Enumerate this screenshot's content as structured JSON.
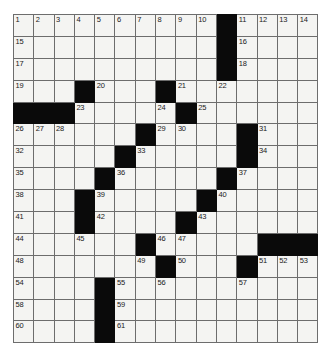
{
  "puzzle": {
    "type": "crossword-grid",
    "rows": 15,
    "columns": 15,
    "cell_fill_color": "#f4f4f2",
    "block_color": "#0a0a0a",
    "grid_line_color": "#6d6d6d",
    "number_color": "#1a1a1a",
    "background_color": "#ffffff",
    "highest_clue_number": 61,
    "block_count": 51,
    "grid": [
      [
        {
          "block": false,
          "num": "1"
        },
        {
          "block": false,
          "num": "2"
        },
        {
          "block": false,
          "num": "3"
        },
        {
          "block": false,
          "num": "4"
        },
        {
          "block": false,
          "num": "5"
        },
        {
          "block": false,
          "num": "6"
        },
        {
          "block": false,
          "num": "7"
        },
        {
          "block": false,
          "num": "8"
        },
        {
          "block": false,
          "num": "9"
        },
        {
          "block": false,
          "num": "10"
        },
        {
          "block": true,
          "num": ""
        },
        {
          "block": false,
          "num": "11"
        },
        {
          "block": false,
          "num": "12"
        },
        {
          "block": false,
          "num": "13"
        },
        {
          "block": false,
          "num": "14"
        }
      ],
      [
        {
          "block": false,
          "num": "15"
        },
        {
          "block": false,
          "num": ""
        },
        {
          "block": false,
          "num": ""
        },
        {
          "block": false,
          "num": ""
        },
        {
          "block": false,
          "num": ""
        },
        {
          "block": false,
          "num": ""
        },
        {
          "block": false,
          "num": ""
        },
        {
          "block": false,
          "num": ""
        },
        {
          "block": false,
          "num": ""
        },
        {
          "block": false,
          "num": ""
        },
        {
          "block": true,
          "num": ""
        },
        {
          "block": false,
          "num": "16"
        },
        {
          "block": false,
          "num": ""
        },
        {
          "block": false,
          "num": ""
        },
        {
          "block": false,
          "num": ""
        }
      ],
      [
        {
          "block": false,
          "num": "17"
        },
        {
          "block": false,
          "num": ""
        },
        {
          "block": false,
          "num": ""
        },
        {
          "block": false,
          "num": ""
        },
        {
          "block": false,
          "num": ""
        },
        {
          "block": false,
          "num": ""
        },
        {
          "block": false,
          "num": ""
        },
        {
          "block": false,
          "num": ""
        },
        {
          "block": false,
          "num": ""
        },
        {
          "block": false,
          "num": ""
        },
        {
          "block": true,
          "num": ""
        },
        {
          "block": false,
          "num": "18"
        },
        {
          "block": false,
          "num": ""
        },
        {
          "block": false,
          "num": ""
        },
        {
          "block": false,
          "num": ""
        }
      ],
      [
        {
          "block": false,
          "num": "19"
        },
        {
          "block": false,
          "num": ""
        },
        {
          "block": false,
          "num": ""
        },
        {
          "block": true,
          "num": ""
        },
        {
          "block": false,
          "num": "20"
        },
        {
          "block": false,
          "num": ""
        },
        {
          "block": false,
          "num": ""
        },
        {
          "block": true,
          "num": ""
        },
        {
          "block": false,
          "num": "21"
        },
        {
          "block": false,
          "num": ""
        },
        {
          "block": false,
          "num": "22"
        },
        {
          "block": false,
          "num": ""
        },
        {
          "block": false,
          "num": ""
        },
        {
          "block": false,
          "num": ""
        },
        {
          "block": false,
          "num": ""
        }
      ],
      [
        {
          "block": true,
          "num": ""
        },
        {
          "block": true,
          "num": ""
        },
        {
          "block": true,
          "num": ""
        },
        {
          "block": false,
          "num": "23"
        },
        {
          "block": false,
          "num": ""
        },
        {
          "block": false,
          "num": ""
        },
        {
          "block": false,
          "num": ""
        },
        {
          "block": false,
          "num": "24"
        },
        {
          "block": true,
          "num": ""
        },
        {
          "block": false,
          "num": "25"
        },
        {
          "block": false,
          "num": ""
        },
        {
          "block": false,
          "num": ""
        },
        {
          "block": false,
          "num": ""
        },
        {
          "block": false,
          "num": ""
        },
        {
          "block": false,
          "num": ""
        }
      ],
      [
        {
          "block": false,
          "num": "26"
        },
        {
          "block": false,
          "num": "27"
        },
        {
          "block": false,
          "num": "28"
        },
        {
          "block": false,
          "num": ""
        },
        {
          "block": false,
          "num": ""
        },
        {
          "block": false,
          "num": ""
        },
        {
          "block": true,
          "num": ""
        },
        {
          "block": false,
          "num": "29"
        },
        {
          "block": false,
          "num": "30"
        },
        {
          "block": false,
          "num": ""
        },
        {
          "block": false,
          "num": ""
        },
        {
          "block": true,
          "num": ""
        },
        {
          "block": false,
          "num": "31"
        },
        {
          "block": false,
          "num": ""
        },
        {
          "block": false,
          "num": ""
        }
      ],
      [
        {
          "block": false,
          "num": "32"
        },
        {
          "block": false,
          "num": ""
        },
        {
          "block": false,
          "num": ""
        },
        {
          "block": false,
          "num": ""
        },
        {
          "block": false,
          "num": ""
        },
        {
          "block": true,
          "num": ""
        },
        {
          "block": false,
          "num": "33"
        },
        {
          "block": false,
          "num": ""
        },
        {
          "block": false,
          "num": ""
        },
        {
          "block": false,
          "num": ""
        },
        {
          "block": false,
          "num": ""
        },
        {
          "block": true,
          "num": ""
        },
        {
          "block": false,
          "num": "34"
        },
        {
          "block": false,
          "num": ""
        },
        {
          "block": false,
          "num": ""
        }
      ],
      [
        {
          "block": false,
          "num": "35"
        },
        {
          "block": false,
          "num": ""
        },
        {
          "block": false,
          "num": ""
        },
        {
          "block": false,
          "num": ""
        },
        {
          "block": true,
          "num": ""
        },
        {
          "block": false,
          "num": "36"
        },
        {
          "block": false,
          "num": ""
        },
        {
          "block": false,
          "num": ""
        },
        {
          "block": false,
          "num": ""
        },
        {
          "block": false,
          "num": ""
        },
        {
          "block": true,
          "num": ""
        },
        {
          "block": false,
          "num": "37"
        },
        {
          "block": false,
          "num": ""
        },
        {
          "block": false,
          "num": ""
        },
        {
          "block": false,
          "num": ""
        }
      ],
      [
        {
          "block": false,
          "num": "38"
        },
        {
          "block": false,
          "num": ""
        },
        {
          "block": false,
          "num": ""
        },
        {
          "block": true,
          "num": ""
        },
        {
          "block": false,
          "num": "39"
        },
        {
          "block": false,
          "num": ""
        },
        {
          "block": false,
          "num": ""
        },
        {
          "block": false,
          "num": ""
        },
        {
          "block": false,
          "num": ""
        },
        {
          "block": true,
          "num": ""
        },
        {
          "block": false,
          "num": "40"
        },
        {
          "block": false,
          "num": ""
        },
        {
          "block": false,
          "num": ""
        },
        {
          "block": false,
          "num": ""
        },
        {
          "block": false,
          "num": ""
        }
      ],
      [
        {
          "block": false,
          "num": "41"
        },
        {
          "block": false,
          "num": ""
        },
        {
          "block": false,
          "num": ""
        },
        {
          "block": true,
          "num": ""
        },
        {
          "block": false,
          "num": "42"
        },
        {
          "block": false,
          "num": ""
        },
        {
          "block": false,
          "num": ""
        },
        {
          "block": false,
          "num": ""
        },
        {
          "block": true,
          "num": ""
        },
        {
          "block": false,
          "num": "43"
        },
        {
          "block": false,
          "num": ""
        },
        {
          "block": false,
          "num": ""
        },
        {
          "block": false,
          "num": ""
        },
        {
          "block": false,
          "num": ""
        },
        {
          "block": false,
          "num": ""
        }
      ],
      [
        {
          "block": false,
          "num": "44"
        },
        {
          "block": false,
          "num": ""
        },
        {
          "block": false,
          "num": ""
        },
        {
          "block": false,
          "num": "45"
        },
        {
          "block": false,
          "num": ""
        },
        {
          "block": false,
          "num": ""
        },
        {
          "block": true,
          "num": ""
        },
        {
          "block": false,
          "num": "46"
        },
        {
          "block": false,
          "num": "47"
        },
        {
          "block": false,
          "num": ""
        },
        {
          "block": false,
          "num": ""
        },
        {
          "block": false,
          "num": ""
        },
        {
          "block": true,
          "num": ""
        },
        {
          "block": true,
          "num": ""
        },
        {
          "block": true,
          "num": ""
        }
      ],
      [
        {
          "block": false,
          "num": "48"
        },
        {
          "block": false,
          "num": ""
        },
        {
          "block": false,
          "num": ""
        },
        {
          "block": false,
          "num": ""
        },
        {
          "block": false,
          "num": ""
        },
        {
          "block": false,
          "num": ""
        },
        {
          "block": false,
          "num": "49"
        },
        {
          "block": true,
          "num": ""
        },
        {
          "block": false,
          "num": "50"
        },
        {
          "block": false,
          "num": ""
        },
        {
          "block": false,
          "num": ""
        },
        {
          "block": true,
          "num": ""
        },
        {
          "block": false,
          "num": "51"
        },
        {
          "block": false,
          "num": "52"
        },
        {
          "block": false,
          "num": "53"
        }
      ],
      [
        {
          "block": false,
          "num": "54"
        },
        {
          "block": false,
          "num": ""
        },
        {
          "block": false,
          "num": ""
        },
        {
          "block": false,
          "num": ""
        },
        {
          "block": true,
          "num": ""
        },
        {
          "block": false,
          "num": "55"
        },
        {
          "block": false,
          "num": ""
        },
        {
          "block": false,
          "num": "56"
        },
        {
          "block": false,
          "num": ""
        },
        {
          "block": false,
          "num": ""
        },
        {
          "block": false,
          "num": ""
        },
        {
          "block": false,
          "num": "57"
        },
        {
          "block": false,
          "num": ""
        },
        {
          "block": false,
          "num": ""
        },
        {
          "block": false,
          "num": ""
        }
      ],
      [
        {
          "block": false,
          "num": "58"
        },
        {
          "block": false,
          "num": ""
        },
        {
          "block": false,
          "num": ""
        },
        {
          "block": false,
          "num": ""
        },
        {
          "block": true,
          "num": ""
        },
        {
          "block": false,
          "num": "59"
        },
        {
          "block": false,
          "num": ""
        },
        {
          "block": false,
          "num": ""
        },
        {
          "block": false,
          "num": ""
        },
        {
          "block": false,
          "num": ""
        },
        {
          "block": false,
          "num": ""
        },
        {
          "block": false,
          "num": ""
        },
        {
          "block": false,
          "num": ""
        },
        {
          "block": false,
          "num": ""
        },
        {
          "block": false,
          "num": ""
        }
      ],
      [
        {
          "block": false,
          "num": "60"
        },
        {
          "block": false,
          "num": ""
        },
        {
          "block": false,
          "num": ""
        },
        {
          "block": false,
          "num": ""
        },
        {
          "block": true,
          "num": ""
        },
        {
          "block": false,
          "num": "61"
        },
        {
          "block": false,
          "num": ""
        },
        {
          "block": false,
          "num": ""
        },
        {
          "block": false,
          "num": ""
        },
        {
          "block": false,
          "num": ""
        },
        {
          "block": false,
          "num": ""
        },
        {
          "block": false,
          "num": ""
        },
        {
          "block": false,
          "num": ""
        },
        {
          "block": false,
          "num": ""
        },
        {
          "block": false,
          "num": ""
        }
      ]
    ]
  }
}
